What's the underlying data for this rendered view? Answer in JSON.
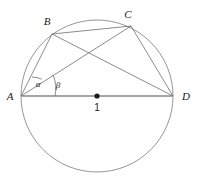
{
  "figure": {
    "width": 197,
    "height": 179,
    "background": "#ffffff",
    "stroke_color": "#6e6e6e",
    "baseline_color": "#9a9a9a",
    "text_color": "#1a1a1a"
  },
  "geometry": {
    "circle": {
      "cx": 97,
      "cy": 96,
      "r": 76
    },
    "points": {
      "A": {
        "x": 21,
        "y": 96,
        "label": "A",
        "label_x": 10,
        "label_y": 96
      },
      "B": {
        "x": 52,
        "y": 34,
        "label": "B",
        "label_x": 47,
        "label_y": 21
      },
      "C": {
        "x": 131,
        "y": 26,
        "label": "C",
        "label_x": 128,
        "label_y": 14
      },
      "D": {
        "x": 173,
        "y": 96,
        "label": "D",
        "label_x": 186,
        "label_y": 96
      },
      "O": {
        "x": 97,
        "y": 96,
        "label": "1",
        "label_x": 97,
        "label_y": 108,
        "dot_r": 2.6
      }
    },
    "chords": [
      {
        "name": "AB",
        "from": "A",
        "to": "B"
      },
      {
        "name": "AC",
        "from": "A",
        "to": "C"
      },
      {
        "name": "BC",
        "from": "B",
        "to": "C"
      },
      {
        "name": "BD",
        "from": "B",
        "to": "D"
      },
      {
        "name": "CD",
        "from": "C",
        "to": "D"
      },
      {
        "name": "AD",
        "from": "A",
        "to": "D"
      }
    ],
    "angles": [
      {
        "name": "alpha",
        "symbol": "α",
        "vertex": "A",
        "between": [
          "AB",
          "AC"
        ],
        "arc_r": 22,
        "label_x": 38,
        "label_y": 84
      },
      {
        "name": "beta",
        "symbol": "β",
        "vertex": "A",
        "between": [
          "AC",
          "AD"
        ],
        "arc_r": 34,
        "label_x": 58,
        "label_y": 85
      }
    ]
  },
  "labels": {
    "a": "A",
    "b": "B",
    "c": "C",
    "d": "D",
    "center": "1",
    "alpha": "α",
    "beta": "β"
  }
}
